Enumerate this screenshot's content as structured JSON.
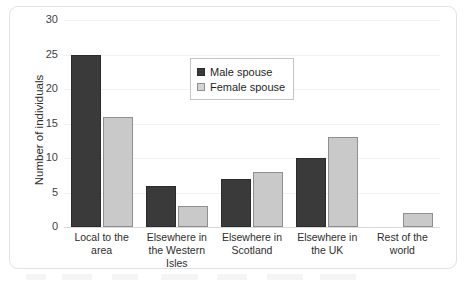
{
  "chart_data": {
    "type": "bar",
    "title": "",
    "xlabel": "",
    "ylabel": "Number of individuals",
    "ylim": [
      0,
      30
    ],
    "ytick_step": 5,
    "yticks": [
      0,
      5,
      10,
      15,
      20,
      25,
      30
    ],
    "grid": true,
    "legend_position": "inside upper-center",
    "categories": [
      "Local to the area",
      "Elsewhere in the Western Isles",
      "Elsewhere in Scotland",
      "Elsewhere in the UK",
      "Rest of the world"
    ],
    "category_lines": [
      [
        "Local to the",
        "area"
      ],
      [
        "Elsewhere in",
        "the Western",
        "Isles"
      ],
      [
        "Elsewhere in",
        "Scotland"
      ],
      [
        "Elsewhere in",
        "the UK"
      ],
      [
        "Rest of the",
        "world"
      ]
    ],
    "series": [
      {
        "name": "Male spouse",
        "color": "#3a3a3a",
        "values": [
          25,
          6,
          7,
          10,
          0
        ]
      },
      {
        "name": "Female spouse",
        "color": "#c9c9c9",
        "values": [
          16,
          3,
          8,
          13,
          2
        ]
      }
    ]
  },
  "legend": {
    "items": [
      {
        "label": "Male spouse",
        "swatch": "male"
      },
      {
        "label": "Female spouse",
        "swatch": "female"
      }
    ]
  },
  "axis": {
    "y_title": "Number of individuals"
  }
}
